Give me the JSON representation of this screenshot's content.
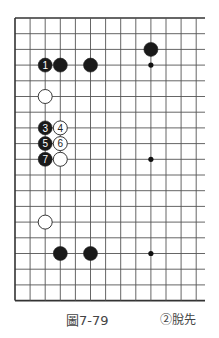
{
  "figure": {
    "label": "圖7-79",
    "note": "②脫先"
  },
  "board": {
    "origin_x": 15,
    "origin_y": 18,
    "spacing_x": 15.1,
    "spacing_y": 15.7,
    "cols": 13,
    "rows": 19,
    "right_extension": 205,
    "line_color": "#555555",
    "border_color": "#333333"
  },
  "star_points": [
    {
      "col": 9,
      "row": 3
    },
    {
      "col": 9,
      "row": 9
    },
    {
      "col": 9,
      "row": 15
    }
  ],
  "stones": [
    {
      "color": "black",
      "col": 2,
      "row": 3,
      "label": "1"
    },
    {
      "color": "black",
      "col": 3,
      "row": 3,
      "label": ""
    },
    {
      "color": "black",
      "col": 5,
      "row": 3,
      "label": ""
    },
    {
      "color": "black",
      "col": 9,
      "row": 2,
      "label": ""
    },
    {
      "color": "white",
      "col": 2,
      "row": 5,
      "label": ""
    },
    {
      "color": "black",
      "col": 2,
      "row": 7,
      "label": "3"
    },
    {
      "color": "white",
      "col": 3,
      "row": 7,
      "label": "4"
    },
    {
      "color": "black",
      "col": 2,
      "row": 8,
      "label": "5"
    },
    {
      "color": "white",
      "col": 3,
      "row": 8,
      "label": "6"
    },
    {
      "color": "black",
      "col": 2,
      "row": 9,
      "label": "7"
    },
    {
      "color": "white",
      "col": 3,
      "row": 9,
      "label": ""
    },
    {
      "color": "white",
      "col": 2,
      "row": 13,
      "label": ""
    },
    {
      "color": "black",
      "col": 3,
      "row": 15,
      "label": ""
    },
    {
      "color": "black",
      "col": 5,
      "row": 15,
      "label": ""
    }
  ]
}
